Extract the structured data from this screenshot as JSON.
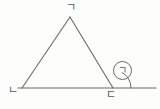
{
  "figure": {
    "kind": "geometry-diagram",
    "background_color": "#fdfdfc",
    "stroke_color": "#6a6a6c",
    "label_color": "#58585a",
    "vertices": {
      "apex": {
        "label": "ㄱ",
        "x": 70,
        "y": 17
      },
      "bottom_left": {
        "label": "ㄴ",
        "x": 22,
        "y": 88
      },
      "bottom_right": {
        "label": "ㄷ",
        "x": 113,
        "y": 88
      }
    },
    "baseline": {
      "start_x": 18,
      "end_x": 156,
      "y": 88,
      "extends_past_vertex": true
    },
    "angle_mark": {
      "symbol": "ㄱ",
      "circled": true,
      "at_vertex": "bottom_right",
      "type": "exterior-angle",
      "arc_radius": 18
    }
  }
}
